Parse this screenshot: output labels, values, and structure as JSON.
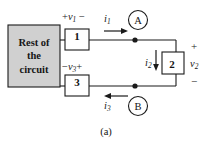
{
  "figure": {
    "caption": "(a)",
    "background_color": "#ffffff",
    "line_color": "#1a1a1a",
    "block_fill_color": "#d0d0d0"
  },
  "blocks": {
    "rest_of_circuit": {
      "line1": "Rest of",
      "line2": "the",
      "line3": "circuit"
    },
    "element_1": {
      "number": "1"
    },
    "element_2": {
      "number": "2"
    },
    "element_3": {
      "number": "3"
    }
  },
  "meters": [
    {
      "name": "meter-a",
      "letter": "A"
    },
    {
      "name": "meter-b",
      "letter": "B"
    }
  ],
  "labels": {
    "v1": {
      "left_sign": "+",
      "symbol": "v",
      "subscript": "1",
      "right_sign": "−"
    },
    "v3": {
      "left_sign": "−",
      "symbol": "v",
      "subscript": "3",
      "right_sign": "+"
    },
    "v2": {
      "symbol": "v",
      "subscript": "2",
      "plus": "+",
      "minus": "−"
    },
    "i1": {
      "symbol": "i",
      "subscript": "1",
      "direction": "right"
    },
    "i2": {
      "symbol": "i",
      "subscript": "2",
      "direction": "down"
    },
    "i3": {
      "symbol": "i",
      "subscript": "3",
      "direction": "left"
    }
  }
}
